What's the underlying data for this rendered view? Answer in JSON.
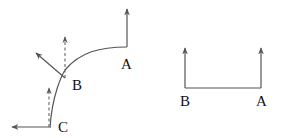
{
  "diagram": {
    "left_figure": {
      "description": "Curved path from C to B to A with direction vectors",
      "points": [
        {
          "id": "A",
          "label": "A"
        },
        {
          "id": "B",
          "label": "B"
        },
        {
          "id": "C",
          "label": "C"
        }
      ],
      "vectors": [
        {
          "at": "A",
          "style": "solid",
          "direction": "up"
        },
        {
          "at": "B",
          "style": "solid",
          "direction": "up-left (tangent)"
        },
        {
          "at": "B",
          "style": "dashed",
          "direction": "up"
        },
        {
          "at": "C",
          "style": "solid",
          "direction": "left"
        },
        {
          "at": "C",
          "style": "dashed",
          "direction": "up"
        }
      ]
    },
    "right_figure": {
      "description": "Straight segment from B to A with parallel upward vectors",
      "points": [
        {
          "id": "B",
          "label": "B"
        },
        {
          "id": "A",
          "label": "A"
        }
      ],
      "vectors": [
        {
          "at": "B",
          "style": "solid",
          "direction": "up"
        },
        {
          "at": "A",
          "style": "solid",
          "direction": "up"
        }
      ]
    },
    "colors": {
      "line": "#555555",
      "text": "#111111",
      "background": "#ffffff"
    }
  }
}
